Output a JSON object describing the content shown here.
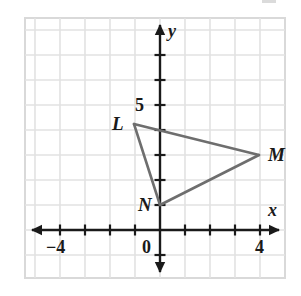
{
  "figure": {
    "kind": "coordinate-plane-triangle",
    "background_color": "#ffffff",
    "frame_color": "#d9d9d9",
    "grid_color": "#e2e2e2",
    "axis_color": "#1a1a1a",
    "shape_color": "#6e6e6e"
  },
  "axes": {
    "x_axis_label": "x",
    "y_axis_label": "y",
    "origin_label": "0",
    "x_ticks": [
      {
        "label": "-4",
        "value": -4,
        "show_label": true
      },
      {
        "label": "",
        "value": -3,
        "show_label": false
      },
      {
        "label": "",
        "value": -2,
        "show_label": false
      },
      {
        "label": "",
        "value": -1,
        "show_label": false
      },
      {
        "label": "",
        "value": 1,
        "show_label": false
      },
      {
        "label": "",
        "value": 2,
        "show_label": false
      },
      {
        "label": "",
        "value": 3,
        "show_label": false
      },
      {
        "label": "4",
        "value": 4,
        "show_label": true
      }
    ],
    "y_ticks": [
      {
        "label": "",
        "value": 1,
        "show_label": false
      },
      {
        "label": "",
        "value": 2,
        "show_label": false
      },
      {
        "label": "",
        "value": 3,
        "show_label": false
      },
      {
        "label": "",
        "value": 4,
        "show_label": false
      },
      {
        "label": "5",
        "value": 5,
        "show_label": true
      },
      {
        "label": "",
        "value": 6,
        "show_label": false
      },
      {
        "label": "",
        "value": 7,
        "show_label": false
      },
      {
        "label": "",
        "value": -1,
        "show_label": false
      }
    ],
    "x_range": [
      -5.4,
      5.0
    ],
    "y_range": [
      -2.6,
      8.4
    ],
    "unit_px": 25
  },
  "triangle": {
    "name": "LMN",
    "vertices": [
      {
        "label": "L",
        "x": -1.04,
        "y": 4.24,
        "label_dx": -22,
        "label_dy": -10
      },
      {
        "label": "M",
        "x": 3.96,
        "y": 3.0,
        "label_dx": 9,
        "label_dy": -10
      },
      {
        "label": "N",
        "x": 0.0,
        "y": 1.0,
        "label_dx": -22,
        "label_dy": -10
      }
    ],
    "edges": [
      {
        "from": "L",
        "to": "M"
      },
      {
        "from": "M",
        "to": "N"
      },
      {
        "from": "N",
        "to": "L"
      }
    ]
  }
}
